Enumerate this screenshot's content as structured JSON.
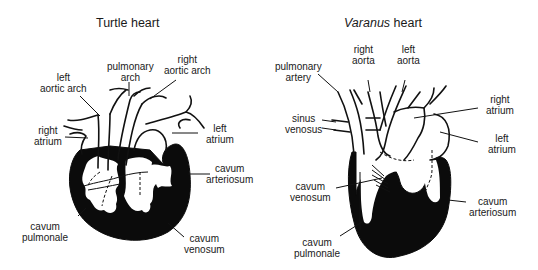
{
  "panels": [
    {
      "title": "Turtle heart",
      "labels": {
        "left_aortic_arch": [
          "left",
          "aortic arch"
        ],
        "pulmonary_arch": [
          "pulmonary",
          "arch"
        ],
        "right_aortic_arch": [
          "right",
          "aortic arch"
        ],
        "right_atrium": [
          "right",
          "atrium"
        ],
        "left_atrium": [
          "left",
          "atrium"
        ],
        "cavum_arteriosum": [
          "cavum",
          "arteriosum"
        ],
        "cavum_pulmonale": [
          "cavum",
          "pulmonale"
        ],
        "cavum_venosum": [
          "cavum",
          "venosum"
        ]
      }
    },
    {
      "title_italic": "Varanus",
      "title_rest": " heart",
      "labels": {
        "pulmonary_artery": [
          "pulmonary",
          "artery"
        ],
        "right_aorta": [
          "right",
          "aorta"
        ],
        "left_aorta": [
          "left",
          "aorta"
        ],
        "sinus_venosus": [
          "sinus",
          "venosus"
        ],
        "right_atrium": [
          "right",
          "atrium"
        ],
        "left_atrium": [
          "left",
          "atrium"
        ],
        "cavum_venosum": [
          "cavum",
          "venosum"
        ],
        "cavum_arteriosum": [
          "cavum",
          "arteriosum"
        ],
        "cavum_pulmonale": [
          "cavum",
          "pulmonale"
        ]
      }
    }
  ]
}
